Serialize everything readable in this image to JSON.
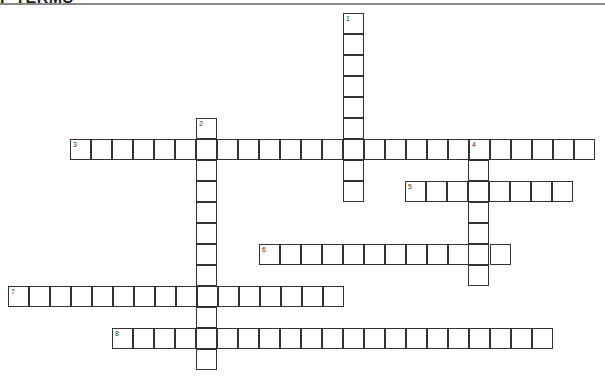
{
  "header": {
    "title": "F TERMS"
  },
  "puzzle": {
    "cell_size": 21,
    "words": [
      {
        "number": "1",
        "direction": "down",
        "x": 343,
        "y": 13,
        "length": 9
      },
      {
        "number": "2",
        "direction": "down",
        "x": 196,
        "y": 118,
        "length": 12
      },
      {
        "number": "3",
        "direction": "across",
        "x": 70,
        "y": 139,
        "length": 25
      },
      {
        "number": "4",
        "direction": "down",
        "x": 468,
        "y": 139,
        "length": 7
      },
      {
        "number": "5",
        "direction": "across",
        "x": 405,
        "y": 181,
        "length": 8
      },
      {
        "number": "6",
        "direction": "across",
        "x": 259,
        "y": 244,
        "length": 12
      },
      {
        "number": "7",
        "direction": "across",
        "x": 8,
        "y": 286,
        "length": 16
      },
      {
        "number": "8",
        "direction": "across",
        "x": 112,
        "y": 328,
        "length": 21
      }
    ]
  }
}
